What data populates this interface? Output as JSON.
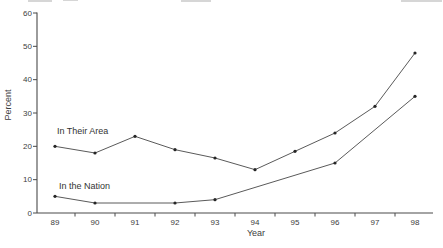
{
  "chart_data": {
    "type": "line",
    "title": "",
    "xlabel": "Year",
    "ylabel": "Percent",
    "x_categories": [
      "89",
      "90",
      "91",
      "92",
      "93",
      "94",
      "95",
      "96",
      "97",
      "98"
    ],
    "ylim": [
      0,
      60
    ],
    "y_ticks": [
      0,
      10,
      20,
      30,
      40,
      50,
      60
    ],
    "grid": false,
    "legend": "inline-labels",
    "series": [
      {
        "name": "In Their Area",
        "x": [
          "89",
          "90",
          "91",
          "92",
          "93",
          "94",
          "95",
          "96",
          "97",
          "98"
        ],
        "values": [
          20,
          18,
          23,
          19,
          16.5,
          13,
          18.5,
          24,
          32,
          48
        ]
      },
      {
        "name": "In the Nation",
        "x": [
          "89",
          "90",
          "92",
          "93",
          "96",
          "98"
        ],
        "values": [
          5,
          3,
          3,
          4,
          15,
          35
        ]
      }
    ]
  },
  "colors": {
    "background": "#ffffff",
    "axis": "#4a4a4a",
    "line": "#5a5a5a",
    "marker": "#262626",
    "text": "#3d3d3d"
  }
}
